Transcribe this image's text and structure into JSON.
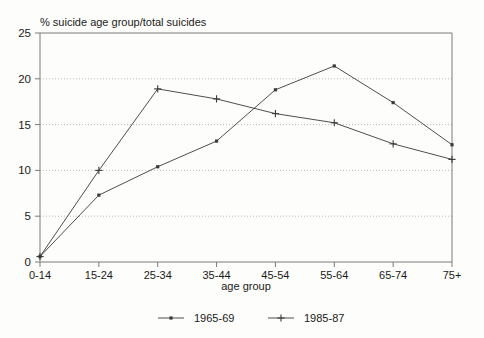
{
  "chart_data": {
    "type": "line",
    "title": "",
    "ylabel": "% suicide age group/total suicides",
    "xlabel": "age group",
    "categories": [
      "0-14",
      "15-24",
      "25-34",
      "35-44",
      "45-54",
      "55-64",
      "65-74",
      "75+"
    ],
    "ylim": [
      0,
      25
    ],
    "yticks": [
      0,
      5,
      10,
      15,
      20,
      25
    ],
    "ytick_labels": [
      "0",
      "5",
      "10",
      "15",
      "20",
      "25"
    ],
    "grid": "horizontal-dotted",
    "legend_position": "bottom",
    "series": [
      {
        "name": "1965-69",
        "marker": "dot",
        "values": [
          0.6,
          7.3,
          10.4,
          13.2,
          18.8,
          21.4,
          17.4,
          12.8
        ]
      },
      {
        "name": "1985-87",
        "marker": "plus",
        "values": [
          0.6,
          10.0,
          18.9,
          17.8,
          16.2,
          15.2,
          12.9,
          11.2
        ]
      }
    ]
  },
  "legend": {
    "items": [
      {
        "label": "1965-69"
      },
      {
        "label": "1985-87"
      }
    ]
  },
  "colors": {
    "line": "#3a3a3a",
    "grid": "#bcbcbc",
    "frame": "#7a7a7a",
    "text": "#1a1a1a",
    "background": "#fdfdfb"
  }
}
